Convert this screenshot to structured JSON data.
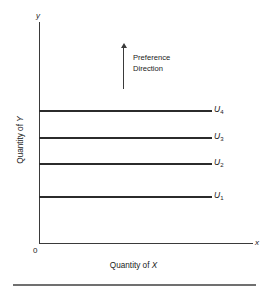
{
  "figure": {
    "background_color": "#ffffff",
    "line_color": "#2b2b2b",
    "axis_color": "#3a3a3a",
    "rule_color": "#707070"
  },
  "axes": {
    "y_cap": "y",
    "x_cap": "x",
    "origin_label": "0",
    "y_title_prefix": "Quantity of ",
    "y_title_var": "Y",
    "x_title_prefix": "Quantity of ",
    "x_title_var": "X"
  },
  "annotation": {
    "arrow_name": "up-arrow-icon",
    "line1": "Preference",
    "line2": "Direction"
  },
  "curves": [
    {
      "label_base": "U",
      "label_sub": "4",
      "y_px": 110,
      "end_x_px": 212
    },
    {
      "label_base": "U",
      "label_sub": "3",
      "y_px": 137,
      "end_x_px": 212
    },
    {
      "label_base": "U",
      "label_sub": "2",
      "y_px": 163,
      "end_x_px": 212
    },
    {
      "label_base": "U",
      "label_sub": "1",
      "y_px": 196,
      "end_x_px": 212
    }
  ],
  "chart_data": {
    "type": "line",
    "title": "",
    "subtitle": "",
    "xlabel": "Quantity of X",
    "ylabel": "Quantity of Y",
    "grid": false,
    "legend": "inline-right-of-each-curve",
    "xlim": [
      0,
      100
    ],
    "ylim": [
      0,
      100
    ],
    "xticks": [],
    "yticks": [],
    "annotations": [
      {
        "text": "Preference Direction",
        "type": "arrow",
        "direction": "up",
        "x": 40,
        "y_from": 62,
        "y_to": 80
      }
    ],
    "series": [
      {
        "name": "U1",
        "label": "U₁",
        "x": [
          0,
          100
        ],
        "y": [
          21,
          21
        ],
        "utility_rank": 1
      },
      {
        "name": "U2",
        "label": "U₂",
        "x": [
          0,
          100
        ],
        "y": [
          36,
          36
        ],
        "utility_rank": 2
      },
      {
        "name": "U3",
        "label": "U₃",
        "x": [
          0,
          100
        ],
        "y": [
          48,
          48
        ],
        "utility_rank": 3
      },
      {
        "name": "U4",
        "label": "U₄",
        "x": [
          0,
          100
        ],
        "y": [
          60,
          60
        ],
        "utility_rank": 4
      }
    ]
  }
}
